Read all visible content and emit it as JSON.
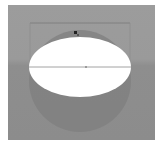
{
  "canvas": {
    "background_top": "#9c9c9c",
    "background_bottom": "#8c8c8c",
    "sphere_color": "#7f7f7f",
    "ellipse_color": "#ffffff",
    "guide_color": "#8a8a8a",
    "selection_color": "#6e6e6e"
  },
  "shapes": {
    "sphere": {
      "cx": 72,
      "cy": 76,
      "r": 51
    },
    "ellipse": {
      "cx": 72,
      "cy": 62,
      "rx": 51,
      "ry": 30
    },
    "guide_line": {
      "y": 62
    },
    "selection_box": {
      "x": 22,
      "y": 18,
      "w": 100
    },
    "cursor": {
      "x": 67,
      "y": 27
    }
  }
}
